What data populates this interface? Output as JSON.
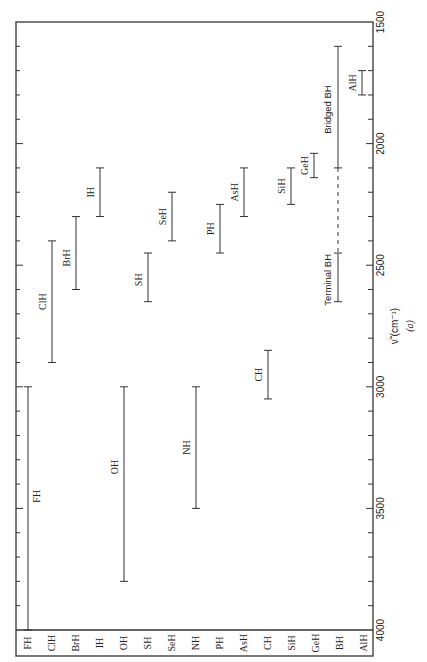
{
  "chart_data": {
    "type": "bar",
    "subtype": "range (floating bar) chart, rotated 90° counter-clockwise",
    "title": "",
    "xlabel": "",
    "ylabel": "ν̃ (cm⁻¹)",
    "panel_label": "(a)",
    "ylim": [
      1500,
      4000
    ],
    "y_ticks_major": [
      1500,
      2000,
      2500,
      3000,
      3500,
      4000
    ],
    "y_tick_minor_step": 100,
    "grid": false,
    "legend": null,
    "categories": [
      "FH",
      "ClH",
      "BrH",
      "IH",
      "OH",
      "SH",
      "SeH",
      "NH",
      "PH",
      "AsH",
      "CH",
      "SiH",
      "GeH",
      "BH",
      "AlH"
    ],
    "ranges": [
      {
        "category": "FH",
        "label": "FH",
        "low": 3000,
        "high": 4000
      },
      {
        "category": "ClH",
        "label": "ClH",
        "low": 2400,
        "high": 2900
      },
      {
        "category": "BrH",
        "label": "BrH",
        "low": 2300,
        "high": 2600
      },
      {
        "category": "IH",
        "label": "IH",
        "low": 2100,
        "high": 2300
      },
      {
        "category": "OH",
        "label": "OH",
        "low": 3000,
        "high": 3800
      },
      {
        "category": "SH",
        "label": "SH",
        "low": 2450,
        "high": 2650
      },
      {
        "category": "SeH",
        "label": "SeH",
        "low": 2200,
        "high": 2400
      },
      {
        "category": "NH",
        "label": "NH",
        "low": 3000,
        "high": 3500
      },
      {
        "category": "PH",
        "label": "PH",
        "low": 2250,
        "high": 2450
      },
      {
        "category": "AsH",
        "label": "AsH",
        "low": 2100,
        "high": 2300
      },
      {
        "category": "CH",
        "label": "CH",
        "low": 2850,
        "high": 3050
      },
      {
        "category": "SiH",
        "label": "SiH",
        "low": 2100,
        "high": 2250
      },
      {
        "category": "GeH",
        "label": "GeH",
        "low": 2040,
        "high": 2140
      },
      {
        "category": "BH",
        "label": "Terminal BH",
        "low": 2450,
        "high": 2650
      },
      {
        "category": "BH",
        "label": "Bridged BH",
        "low": 1600,
        "high": 2100
      },
      {
        "category": "AlH",
        "label": "AlH",
        "low": 1700,
        "high": 1800
      }
    ],
    "annotations": [
      {
        "type": "dashed-connector",
        "category": "BH",
        "from": 2100,
        "to": 2450,
        "note": "dashed line connecting Bridged BH and Terminal BH"
      }
    ]
  },
  "colors": {
    "ink": "#333333",
    "text": "#222222",
    "background": "#ffffff"
  }
}
